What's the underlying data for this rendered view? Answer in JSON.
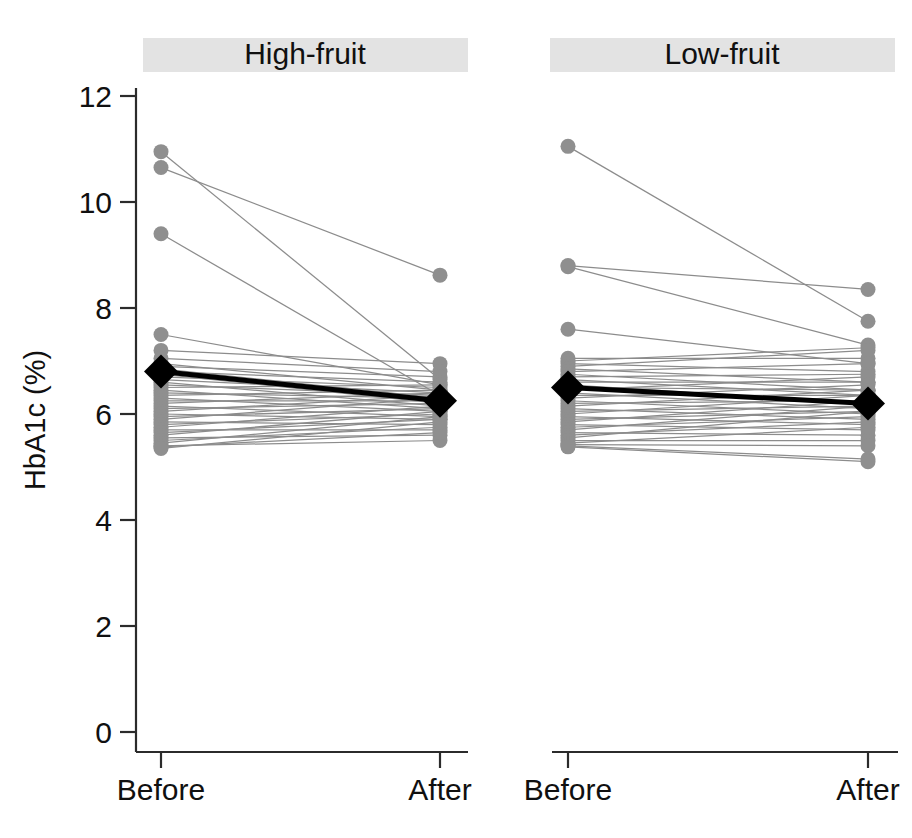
{
  "figure": {
    "type": "paired-before-after-spaghetti",
    "background": "#ffffff",
    "point_color": "#8f8f8f",
    "line_color": "#8c8c8c",
    "mean_color": "#000000",
    "strip_color": "#e3e3e3"
  },
  "axis": {
    "ylabel": "HbA1c (%)",
    "yticks": [
      "0",
      "2",
      "4",
      "6",
      "8",
      "10",
      "12"
    ],
    "ytick_values": [
      0,
      2,
      4,
      6,
      8,
      10,
      12
    ],
    "ylim": [
      0,
      12
    ],
    "xticks": [
      "Before",
      "After"
    ]
  },
  "panels": [
    {
      "title": "High-fruit",
      "xlabels": [
        "Before",
        "After"
      ]
    },
    {
      "title": "Low-fruit",
      "xlabels": [
        "Before",
        "After"
      ]
    }
  ],
  "chart_data": {
    "type": "line",
    "title": "",
    "subtitle": "",
    "xlabel": "",
    "ylabel": "HbA1c (%)",
    "ylim": [
      0,
      12
    ],
    "yticks": [
      0,
      2,
      4,
      6,
      8,
      10,
      12
    ],
    "x": [
      "Before",
      "After"
    ],
    "grid": false,
    "legend": "none",
    "panel_layout": "1x2",
    "panels": [
      {
        "name": "High-fruit",
        "mean": {
          "before": 6.8,
          "after": 6.25
        },
        "pairs": [
          [
            10.95,
            6.65
          ],
          [
            10.65,
            8.62
          ],
          [
            9.4,
            6.35
          ],
          [
            7.5,
            6.55
          ],
          [
            7.2,
            6.95
          ],
          [
            7.05,
            6.8
          ],
          [
            6.95,
            6.45
          ],
          [
            6.9,
            6.7
          ],
          [
            6.85,
            6.3
          ],
          [
            6.8,
            6.6
          ],
          [
            6.75,
            6.2
          ],
          [
            6.7,
            6.5
          ],
          [
            6.65,
            6.4
          ],
          [
            6.6,
            6.15
          ],
          [
            6.55,
            6.35
          ],
          [
            6.5,
            6.55
          ],
          [
            6.45,
            6.1
          ],
          [
            6.4,
            6.3
          ],
          [
            6.35,
            6.45
          ],
          [
            6.3,
            6.05
          ],
          [
            6.25,
            6.25
          ],
          [
            6.2,
            6.4
          ],
          [
            6.15,
            5.95
          ],
          [
            6.1,
            6.2
          ],
          [
            6.05,
            6.35
          ],
          [
            6.0,
            5.9
          ],
          [
            5.95,
            6.1
          ],
          [
            5.9,
            6.3
          ],
          [
            5.85,
            5.8
          ],
          [
            5.8,
            6.0
          ],
          [
            5.75,
            6.15
          ],
          [
            5.7,
            5.7
          ],
          [
            5.65,
            5.9
          ],
          [
            5.6,
            6.05
          ],
          [
            5.55,
            5.6
          ],
          [
            5.5,
            5.75
          ],
          [
            5.45,
            5.95
          ],
          [
            5.4,
            5.5
          ],
          [
            5.38,
            5.65
          ],
          [
            5.35,
            5.85
          ]
        ]
      },
      {
        "name": "Low-fruit",
        "mean": {
          "before": 6.5,
          "after": 6.2
        },
        "pairs": [
          [
            11.05,
            7.75
          ],
          [
            8.8,
            8.35
          ],
          [
            8.78,
            7.3
          ],
          [
            7.6,
            6.95
          ],
          [
            7.05,
            7.05
          ],
          [
            7.0,
            7.25
          ],
          [
            6.95,
            6.8
          ],
          [
            6.9,
            7.2
          ],
          [
            6.85,
            6.6
          ],
          [
            6.8,
            6.95
          ],
          [
            6.75,
            6.45
          ],
          [
            6.7,
            6.75
          ],
          [
            6.65,
            6.35
          ],
          [
            6.6,
            6.6
          ],
          [
            6.55,
            6.2
          ],
          [
            6.5,
            6.45
          ],
          [
            6.45,
            6.7
          ],
          [
            6.4,
            6.1
          ],
          [
            6.35,
            6.35
          ],
          [
            6.3,
            6.55
          ],
          [
            6.25,
            6.0
          ],
          [
            6.2,
            6.25
          ],
          [
            6.15,
            6.45
          ],
          [
            6.1,
            5.9
          ],
          [
            6.05,
            6.15
          ],
          [
            6.0,
            6.35
          ],
          [
            5.95,
            5.8
          ],
          [
            5.9,
            6.05
          ],
          [
            5.85,
            6.25
          ],
          [
            5.8,
            5.7
          ],
          [
            5.75,
            5.95
          ],
          [
            5.7,
            6.15
          ],
          [
            5.65,
            5.6
          ],
          [
            5.6,
            5.85
          ],
          [
            5.55,
            6.05
          ],
          [
            5.5,
            5.5
          ],
          [
            5.45,
            5.75
          ],
          [
            5.42,
            5.4
          ],
          [
            5.4,
            5.15
          ],
          [
            5.38,
            5.1
          ]
        ]
      }
    ]
  }
}
